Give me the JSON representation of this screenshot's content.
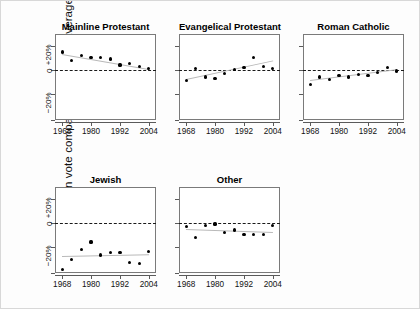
{
  "figure": {
    "ylabel": "Republican vote compared to national average",
    "background": "#fdfdfd",
    "dot_color": "#000000",
    "fit_color": "#b9b9b9",
    "zero_color": "#1a1a1a"
  },
  "axes": {
    "y_ticks": [
      {
        "value": 20,
        "label": "+20%"
      },
      {
        "value": 0,
        "label": "0"
      },
      {
        "value": -20,
        "label": "−20%"
      }
    ],
    "y_range": [
      -42,
      30
    ],
    "x_ticks": [
      {
        "value": 1968,
        "label": "1968"
      },
      {
        "value": 1980,
        "label": "1980"
      },
      {
        "value": 1992,
        "label": "1992"
      },
      {
        "value": 2004,
        "label": "2004"
      }
    ],
    "x_range": [
      1965,
      2007
    ]
  },
  "chart_data": {
    "type": "scatter",
    "xlabel": "",
    "ylabel": "Republican vote compared to national average",
    "xlim": [
      1965,
      2007
    ],
    "ylim": [
      -42,
      30
    ],
    "grid": false,
    "legend": "none",
    "annotations": [
      "Dashed horizontal line marks the national average (0)",
      "Light gray line is the fitted linear trend for each group"
    ],
    "x": [
      1968,
      1972,
      1976,
      1980,
      1984,
      1988,
      1992,
      1996,
      2000,
      2004
    ],
    "panels": [
      {
        "name": "Mainline Protestant",
        "values": [
          15,
          8,
          12,
          10,
          10,
          9,
          4,
          5,
          3,
          1
        ],
        "fit": [
          13.5,
          1.0
        ]
      },
      {
        "name": "Evangelical Protestant",
        "values": [
          -9,
          1,
          -6,
          -7,
          -3,
          0,
          2,
          10,
          3,
          1
        ],
        "fit": [
          -8.0,
          7.5
        ]
      },
      {
        "name": "Roman Catholic",
        "values": [
          -12,
          -6,
          -8,
          -5,
          -6,
          -4,
          -5,
          -2,
          2,
          -1
        ],
        "fit": [
          -8.5,
          0.5
        ]
      },
      {
        "name": "Jewish",
        "values": [
          -39,
          -31,
          -22,
          -16,
          -27,
          -25,
          -25,
          -33,
          -34,
          -24
        ],
        "fit": [
          -27.5,
          -26.0
        ]
      },
      {
        "name": "Other",
        "values": [
          -3,
          -12,
          -2,
          -1,
          -8,
          -6,
          -10,
          -10,
          -10,
          -2
        ],
        "fit": [
          -5.0,
          -7.5
        ]
      }
    ]
  }
}
